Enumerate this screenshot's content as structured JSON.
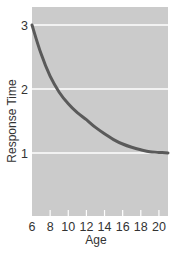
{
  "chart_data": {
    "type": "line",
    "title": "",
    "xlabel": "Age",
    "ylabel": "Response Time",
    "xlim": [
      6,
      21
    ],
    "ylim": [
      0,
      3.15
    ],
    "grid": {
      "horizontal": true,
      "vertical": false,
      "color": "#ffffff"
    },
    "background": "#cbcbcb",
    "x_ticks": [
      6,
      8,
      10,
      12,
      14,
      16,
      18,
      20
    ],
    "y_ticks": [
      1,
      2,
      3
    ],
    "series": [
      {
        "name": "Response Time",
        "color": "#5a5a5a",
        "x": [
          6,
          7,
          8,
          9,
          10,
          11,
          12,
          13,
          14,
          15,
          16,
          17,
          18,
          19,
          20,
          21
        ],
        "values": [
          3.0,
          2.55,
          2.2,
          1.95,
          1.77,
          1.63,
          1.52,
          1.4,
          1.3,
          1.21,
          1.14,
          1.09,
          1.05,
          1.02,
          1.01,
          1.0
        ]
      }
    ],
    "legend": null
  }
}
